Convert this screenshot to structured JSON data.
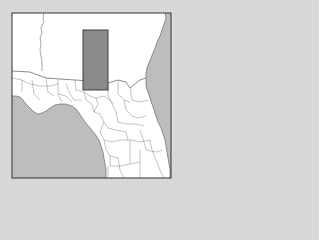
{
  "map": {
    "type": "locator-map",
    "region": "Southeast United States (Georgia / Florida)",
    "colors": {
      "background": "#d9d9d9",
      "land": "#ffffff",
      "water": "#bdbdbd",
      "frame": "#333333",
      "borders": "#6e6e6e",
      "highlight_fill": "#8a8a8a",
      "highlight_stroke": "#333333"
    },
    "frame": {
      "x": 12,
      "y": 13,
      "width": 159,
      "height": 165
    },
    "highlight": {
      "x": 83,
      "y": 30,
      "width": 25,
      "height": 60
    }
  }
}
